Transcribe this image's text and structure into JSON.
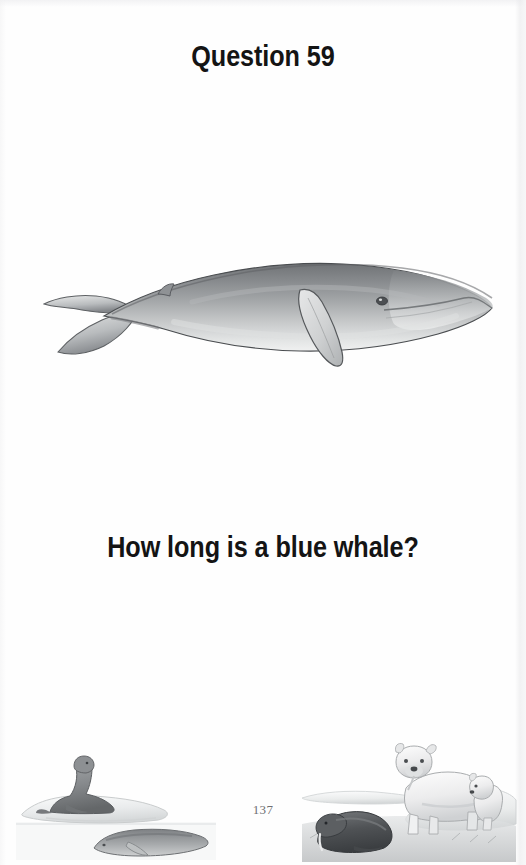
{
  "page": {
    "title": "Question 59",
    "question": "How long is a blue whale?",
    "page_number": "137",
    "background_color": "#fefefe",
    "text_color": "#141414",
    "page_number_color": "#6f6f72"
  },
  "illustrations": {
    "main": {
      "name": "blue-whale-illustration",
      "subject": "blue whale",
      "orientation": "facing right",
      "style": "grayscale pencil/airbrush rendering",
      "parts": [
        "body",
        "tail-flukes",
        "pectoral-fin",
        "dorsal-fin",
        "eye",
        "mouth-line"
      ],
      "colors": {
        "body_dark": "#6f7274",
        "body_mid": "#9a9d9f",
        "body_light": "#d8dadb",
        "belly": "#eceded",
        "outline": "#3f4144"
      }
    },
    "bottom_left": {
      "name": "arctic-vignette-left",
      "subjects": [
        "sea lion on ice floe",
        "small whale in water",
        "ice floe"
      ],
      "colors": {
        "animal": "#8e9092",
        "ice": "#eef0f1",
        "water": "#f4f5f6",
        "outline": "#6c6e70"
      }
    },
    "bottom_right": {
      "name": "arctic-vignette-right",
      "subjects": [
        "polar bear",
        "polar bear cub",
        "walrus",
        "ice floe",
        "tundra ground"
      ],
      "colors": {
        "bear": "#f0f1f2",
        "bear_shade": "#c9cbcd",
        "walrus": "#55585b",
        "ice": "#eef0f1",
        "ground": "#b9bbbd",
        "outline": "#6c6e70"
      }
    }
  }
}
